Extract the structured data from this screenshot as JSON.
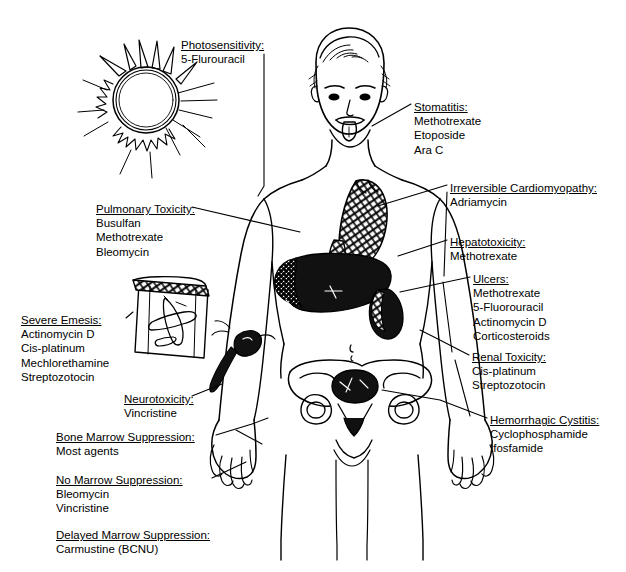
{
  "diagram": {
    "type": "annotated-anatomical-diagram",
    "figure": "human body front view, line drawing"
  },
  "labels": [
    {
      "id": "photosensitivity",
      "heading": "Photosensitivity:",
      "drugs": [
        "5-Flurouracil"
      ],
      "x": 181,
      "y": 38
    },
    {
      "id": "stomatitis",
      "heading": "Stomatitis:",
      "drugs": [
        "Methotrexate",
        "Etoposide",
        "Ara C"
      ],
      "x": 414,
      "y": 100
    },
    {
      "id": "irreversible-cardiomyopathy",
      "heading": "Irreversible Cardiomyopathy:",
      "drugs": [
        "Adriamycin"
      ],
      "x": 450,
      "y": 181
    },
    {
      "id": "pulmonary-toxicity",
      "heading": "Pulmonary Toxicity:",
      "drugs": [
        "Busulfan",
        "Methotrexate",
        "Bleomycin"
      ],
      "x": 96,
      "y": 202
    },
    {
      "id": "hepatotoxicity",
      "heading": "Hepatotoxicity:",
      "drugs": [
        "Methotrexate"
      ],
      "x": 450,
      "y": 235
    },
    {
      "id": "ulcers",
      "heading": "Ulcers:",
      "drugs": [
        "Methotrexate",
        "5-Fluorouracil",
        "Actinomycin D",
        "Corticosteroids"
      ],
      "x": 473,
      "y": 272
    },
    {
      "id": "severe-emesis",
      "heading": "Severe Emesis:",
      "drugs": [
        "Actinomycin D",
        "Cis-platinum",
        "Mechlorethamine",
        "Streptozotocin"
      ],
      "x": 21,
      "y": 313
    },
    {
      "id": "renal-toxicity",
      "heading": "Renal Toxicity:",
      "drugs": [
        "Cis-platinum",
        "Streptozotocin"
      ],
      "x": 472,
      "y": 350
    },
    {
      "id": "neurotoxicity",
      "heading": "Neurotoxicity:",
      "drugs": [
        "Vincristine"
      ],
      "x": 124,
      "y": 392
    },
    {
      "id": "hemorrhagic-cystitis",
      "heading": "Hemorrhagic Cystitis:",
      "drugs": [
        "Cyclophosphamide",
        "Ifosfamide"
      ],
      "x": 490,
      "y": 413
    },
    {
      "id": "bone-marrow-suppression",
      "heading": "Bone Marrow Suppression:",
      "drugs": [
        "Most agents"
      ],
      "x": 56,
      "y": 430
    },
    {
      "id": "no-marrow-suppression",
      "heading": "No Marrow Suppression:",
      "drugs": [
        "Bleomycin",
        "Vincristine"
      ],
      "x": 56,
      "y": 473
    },
    {
      "id": "delayed-marrow-suppression",
      "heading": "Delayed Marrow Suppression:",
      "drugs": [
        "Carmustine (BCNU)"
      ],
      "x": 56,
      "y": 528
    }
  ],
  "illustrations": [
    {
      "id": "sun",
      "name": "sun-drawing",
      "meaning": "sunlight / photosensitivity"
    },
    {
      "id": "head",
      "name": "head-with-tongue-out",
      "meaning": "mouth / stomatitis"
    },
    {
      "id": "lung-heart",
      "name": "hatched-lung-heart",
      "meaning": "lungs and heart"
    },
    {
      "id": "liver",
      "name": "black-liver",
      "meaning": "liver"
    },
    {
      "id": "stomach",
      "name": "stippled-stomach",
      "meaning": "stomach / ulcers"
    },
    {
      "id": "bladder",
      "name": "dark-bladder",
      "meaning": "bladder"
    },
    {
      "id": "pelvis",
      "name": "pelvis-bones",
      "meaning": "bone marrow"
    },
    {
      "id": "emesis-bag",
      "name": "airsickness-bag-with-airplane",
      "meaning": "vomiting / emesis"
    },
    {
      "id": "nerve",
      "name": "nerve-icon",
      "meaning": "peripheral nerve / neurotoxicity"
    }
  ],
  "colors": {
    "ink": "#000000",
    "paper": "#ffffff"
  }
}
